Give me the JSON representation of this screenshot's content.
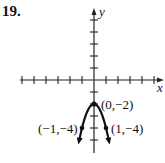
{
  "problem": {
    "number": "19."
  },
  "chart_data": {
    "type": "line",
    "title": "",
    "function": "y = -2x^2 - 2",
    "xlabel": "x",
    "ylabel": "y",
    "xlim": [
      -6,
      6
    ],
    "ylim": [
      -6,
      6
    ],
    "grid": false,
    "tick_spacing": 1,
    "ticks_labeled": false,
    "series": [
      {
        "name": "parabola",
        "x": [
          -1.3,
          -1,
          -0.5,
          0,
          0.5,
          1,
          1.3
        ],
        "y": [
          -5.38,
          -4,
          -2.5,
          -2,
          -2.5,
          -4,
          -5.38
        ],
        "arrows_at_ends": true
      }
    ],
    "points": [
      {
        "label": "(0,−2)",
        "x": 0,
        "y": -2
      },
      {
        "label": "(−1,−4)",
        "x": -1,
        "y": -4
      },
      {
        "label": "(1,−4)",
        "x": 1,
        "y": -4
      }
    ]
  },
  "labels": {
    "x_axis": "x",
    "y_axis": "y",
    "vertex": "(0,−2)",
    "left_point": "(−1,−4)",
    "right_point": "(1,−4)"
  }
}
